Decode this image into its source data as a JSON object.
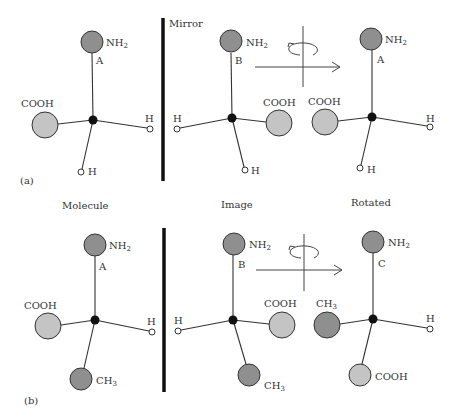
{
  "figure": {
    "mirror_label": "Mirror",
    "column_labels": [
      "Molecule",
      "Image",
      "Rotated"
    ],
    "panels": [
      {
        "label": "(a)",
        "molecules": [
          {
            "name": "molecule",
            "top": {
              "group": "NH",
              "sub": "2",
              "tag": "A"
            },
            "left": {
              "group": "COOH"
            },
            "right": {
              "group": "H"
            },
            "bottom": {
              "group": "H"
            }
          },
          {
            "name": "image",
            "top": {
              "group": "NH",
              "sub": "2",
              "tag": "B"
            },
            "left": {
              "group": "H"
            },
            "right": {
              "group": "COOH"
            },
            "bottom": {
              "group": "H"
            }
          },
          {
            "name": "rotated",
            "top": {
              "group": "NH",
              "sub": "2",
              "tag": "A"
            },
            "left": {
              "group": "COOH"
            },
            "right": {
              "group": "H"
            },
            "bottom": {
              "group": "H"
            }
          }
        ]
      },
      {
        "label": "(b)",
        "molecules": [
          {
            "name": "molecule",
            "top": {
              "group": "NH",
              "sub": "2",
              "tag": "A"
            },
            "left": {
              "group": "COOH"
            },
            "right": {
              "group": "H"
            },
            "bottom": {
              "group": "CH",
              "sub": "3"
            }
          },
          {
            "name": "image",
            "top": {
              "group": "NH",
              "sub": "2",
              "tag": "B"
            },
            "left": {
              "group": "H"
            },
            "right": {
              "group": "COOH"
            },
            "bottom": {
              "group": "CH",
              "sub": "3"
            }
          },
          {
            "name": "rotated",
            "top": {
              "group": "NH",
              "sub": "2",
              "tag": "C"
            },
            "left": {
              "group": "CH",
              "sub": "3"
            },
            "right": {
              "group": "H"
            },
            "bottom": {
              "group": "COOH"
            }
          }
        ]
      }
    ],
    "colors": {
      "amine_ball": "#8f8f8f",
      "carboxyl_ball": "#c4c4c4",
      "methyl_ball": "#8f8f8f",
      "center_atom": "#111111",
      "mirror": "#111111"
    }
  }
}
